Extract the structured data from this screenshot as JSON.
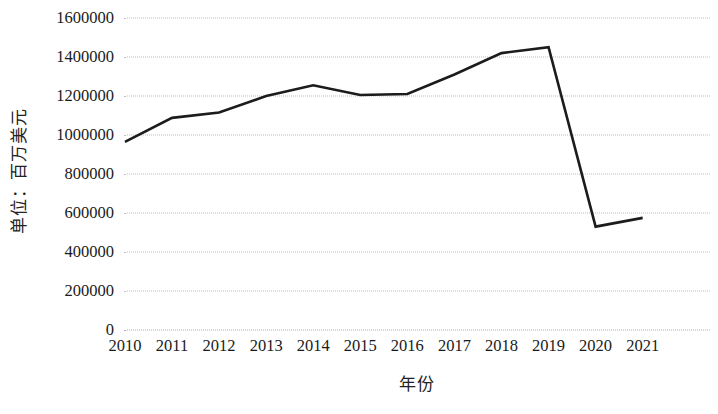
{
  "chart_data": {
    "type": "line",
    "title": "",
    "xlabel": "年份",
    "ylabel": "单位：百万美元",
    "categories": [
      "2010",
      "2011",
      "2012",
      "2013",
      "2014",
      "2015",
      "2016",
      "2017",
      "2018",
      "2019",
      "2020",
      "2021"
    ],
    "series": [
      {
        "name": "",
        "values": [
          965000,
          1088000,
          1115000,
          1200000,
          1255000,
          1205000,
          1210000,
          1310000,
          1420000,
          1450000,
          530000,
          575000
        ]
      }
    ],
    "ylim": [
      0,
      1600000
    ],
    "ytick_values": [
      1600000,
      1400000,
      1200000,
      1000000,
      800000,
      600000,
      400000,
      200000,
      0
    ],
    "ytick_labels": [
      "1600000",
      "1400000",
      "1200000",
      "1000000",
      "800000",
      "600000",
      "400000",
      "200000",
      "0"
    ],
    "grid": true,
    "grid_style": "dotted",
    "grid_color": "#b9bec9",
    "legend": "none",
    "line_color": "#1c1c1c",
    "line_width": 2.6,
    "markers": "none",
    "background": "#ffffff"
  }
}
